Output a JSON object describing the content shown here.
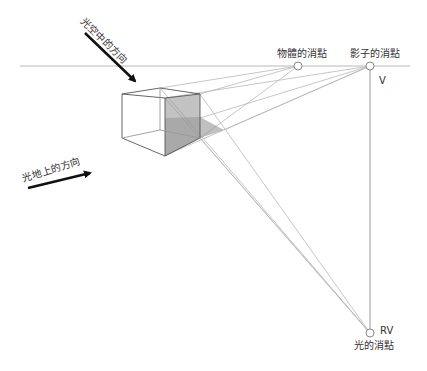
{
  "diagram": {
    "labels": {
      "light_in_air": "光空中的方向",
      "light_on_ground": "光地上的方向",
      "object_vp": "物體的消點",
      "shadow_vp": "影子的消點",
      "v": "V",
      "rv": "RV",
      "light_vp": "光的消點"
    },
    "colors": {
      "line": "#b0b0b0",
      "cube": "#555555",
      "shadow_fill": "#8c8c8c",
      "arrow": "#111111"
    },
    "points": {
      "object_vp": [
        298,
        66
      ],
      "shadow_vp": [
        370,
        66
      ],
      "light_vp": [
        370,
        333
      ],
      "horizon_y": 66
    }
  }
}
